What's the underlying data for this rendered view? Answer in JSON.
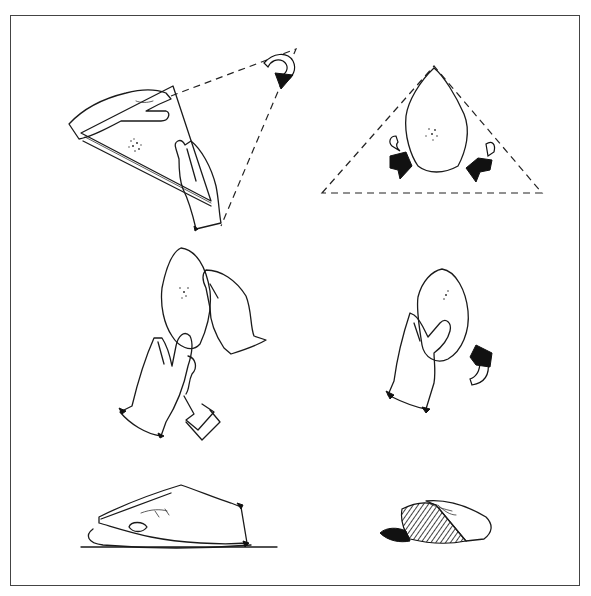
{
  "page": {
    "caption_top": "",
    "caption_top_note": "clipped caption line; only descenders visible"
  },
  "figure": {
    "frame_border_color": "#444444",
    "ink_color": "#1a1a1a",
    "panels": [
      {
        "id": "step-1",
        "label": "hands folding square cloth corner to form triangle",
        "arrow": "curved-arrow-down-right"
      },
      {
        "id": "step-2",
        "label": "cut dough piece centered in dashed triangle with two fold arrows",
        "arrow": "two-curved-arrows-inward"
      },
      {
        "id": "step-3",
        "label": "hands lifting folded piece with brush tool",
        "arrow": ""
      },
      {
        "id": "step-4",
        "label": "one hand holding folded piece with rolling arrow",
        "arrow": "curved-arrow-up"
      },
      {
        "id": "step-5",
        "label": "hand pressing flattened piece on surface",
        "arrow": ""
      },
      {
        "id": "step-6",
        "label": "finished shaped loaf with hatched shading",
        "arrow": ""
      }
    ]
  }
}
